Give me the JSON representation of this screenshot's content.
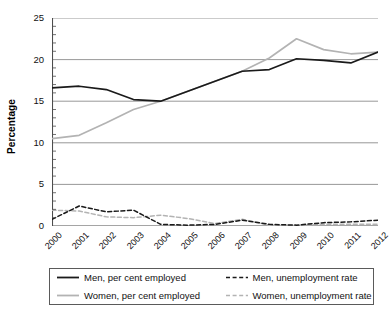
{
  "chart_data": {
    "type": "line",
    "title": "",
    "xlabel": "",
    "ylabel": "Percentage",
    "ylim": [
      0,
      25
    ],
    "yticks": [
      0,
      5,
      10,
      15,
      20,
      25
    ],
    "ytick_labels": [
      "0",
      "5",
      "10",
      "15",
      "20",
      "25"
    ],
    "minor_tick_step": 1,
    "grid": "horizontal",
    "legend_position": "below-plot",
    "x": [
      2000,
      2001,
      2002,
      2003,
      2004,
      2005,
      2006,
      2007,
      2008,
      2009,
      2010,
      2011,
      2012
    ],
    "categories": [
      "2000",
      "2001",
      "2002",
      "2003",
      "2004",
      "2005",
      "2006",
      "2007",
      "2008",
      "2009",
      "2010",
      "2011",
      "2012"
    ],
    "series": [
      {
        "name": "Men, per cent employed",
        "style": "solid",
        "color": "#1a1a1a",
        "values": [
          16.6,
          16.8,
          16.4,
          15.2,
          15.0,
          16.2,
          17.4,
          18.6,
          18.8,
          20.1,
          19.9,
          19.6,
          20.9
        ]
      },
      {
        "name": "Women, per cent employed",
        "style": "solid",
        "color": "#b3b3b3",
        "values": [
          10.5,
          10.9,
          12.4,
          14.0,
          15.0,
          16.2,
          17.4,
          18.6,
          20.2,
          22.5,
          21.2,
          20.7,
          20.9
        ]
      },
      {
        "name": "Men, unemployment rate",
        "style": "dashed",
        "color": "#1a1a1a",
        "values": [
          0.8,
          2.4,
          1.7,
          1.9,
          0.2,
          0.1,
          0.2,
          0.7,
          0.2,
          0.1,
          0.4,
          0.5,
          0.7
        ]
      },
      {
        "name": "Women, unemployment rate",
        "style": "dashed",
        "color": "#b3b3b3",
        "values": [
          1.9,
          1.8,
          1.1,
          1.0,
          1.3,
          0.9,
          0.3,
          0.8,
          0.1,
          0.1,
          0.2,
          0.2,
          0.2
        ]
      }
    ]
  },
  "axis": {
    "y_title": "Percentage",
    "y_tick_labels": [
      "25",
      "20",
      "15",
      "10",
      "5",
      "0"
    ],
    "x_tick_labels": [
      "2000",
      "2001",
      "2002",
      "2003",
      "2004",
      "2005",
      "2006",
      "2007",
      "2008",
      "2009",
      "2010",
      "2011",
      "2012"
    ]
  },
  "legend": {
    "entries": [
      {
        "label": "Men, per cent employed",
        "style": "solid",
        "color": "#1a1a1a"
      },
      {
        "label": "Men, unemployment rate",
        "style": "dashed",
        "color": "#1a1a1a"
      },
      {
        "label": "Women, per cent employed",
        "style": "solid",
        "color": "#b3b3b3"
      },
      {
        "label": "Women, unemployment rate",
        "style": "dashed",
        "color": "#b3b3b3"
      }
    ]
  },
  "colors": {
    "men": "#1a1a1a",
    "women": "#b3b3b3",
    "grid": "#8c8c8c",
    "axis": "#4d4d4d",
    "background": "#ffffff"
  }
}
